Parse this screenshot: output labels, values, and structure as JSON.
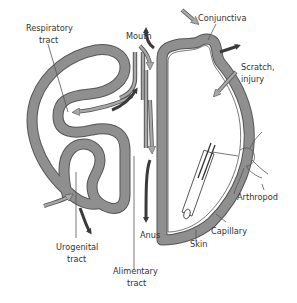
{
  "diagram": {
    "labels": {
      "respiratory_tract_line1": "Respiratory",
      "respiratory_tract_line2": "tract",
      "mouth": "Mouth",
      "conjunctiva": "Conjunctiva",
      "scratch_line1": "Scratch,",
      "scratch_line2": "injury",
      "arthropod": "Arthropod",
      "urogenital_line1": "Urogenital",
      "urogenital_line2": "tract",
      "anus": "Anus",
      "skin": "Skin",
      "capillary": "Capillary",
      "alimentary_line1": "Alimentary",
      "alimentary_line2": "tract"
    },
    "arrow_legend": {
      "dark_arrows": "exit / shedding",
      "light_arrows": "entry / infection"
    },
    "colors": {
      "surface_band": "#8f8f8f",
      "band_outline": "#555555",
      "dark_arrow": "#3a3a3a",
      "light_arrow": "#a8a8a8",
      "text": "#333333",
      "background": "#ffffff"
    }
  }
}
